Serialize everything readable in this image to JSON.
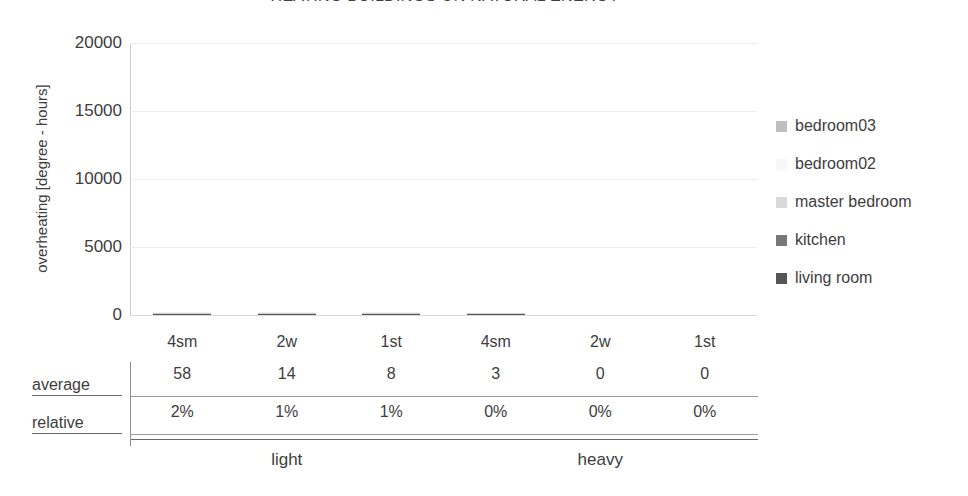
{
  "chart_data": {
    "type": "bar",
    "title": "HEATING BUILDINGS ON NATURAL ENERGY",
    "xlabel": "",
    "ylabel": "overheating [degree - hours]",
    "ylim": [
      0,
      20000
    ],
    "yticks": [
      20000,
      15000,
      10000,
      5000,
      0
    ],
    "ytick_labels": [
      "20000",
      "15000",
      "10000",
      "5000",
      "0"
    ],
    "grid": true,
    "stacked": true,
    "legend_position": "right",
    "categories": [
      "4sm",
      "2w",
      "1st",
      "4sm",
      "2w",
      "1st"
    ],
    "groups": [
      {
        "label": "light",
        "categories": [
          "4sm",
          "2w",
          "1st"
        ]
      },
      {
        "label": "heavy",
        "categories": [
          "4sm",
          "2w",
          "1st"
        ]
      }
    ],
    "series": [
      {
        "name": "living room",
        "color": "#595959",
        "values": [
          14,
          4,
          2,
          1,
          0,
          0
        ]
      },
      {
        "name": "kitchen",
        "color": "#808080",
        "values": [
          13,
          3,
          2,
          1,
          0,
          0
        ]
      },
      {
        "name": "master bedroom",
        "color": "#d0d0d0",
        "values": [
          11,
          3,
          2,
          1,
          0,
          0
        ]
      },
      {
        "name": "bedroom02",
        "color": "#f2f2f2",
        "values": [
          10,
          2,
          1,
          0,
          0,
          0
        ]
      },
      {
        "name": "bedroom03",
        "color": "#bfbfbf",
        "values": [
          10,
          2,
          1,
          0,
          0,
          0
        ]
      }
    ],
    "totals": [
      58,
      14,
      8,
      3,
      0,
      0
    ],
    "annotations": {
      "table": {
        "rows": [
          {
            "header": "average",
            "values": [
              "58",
              "14",
              "8",
              "3",
              "0",
              "0"
            ]
          },
          {
            "header": "relative",
            "values": [
              "2%",
              "1%",
              "1%",
              "0%",
              "0%",
              "0%"
            ]
          }
        ]
      }
    }
  },
  "legend": {
    "items": [
      {
        "label": "bedroom03",
        "color": "#bfbfbf"
      },
      {
        "label": "bedroom02",
        "color": "#f7f7f7"
      },
      {
        "label": "master bedroom",
        "color": "#d8d8d8"
      },
      {
        "label": "kitchen",
        "color": "#787878"
      },
      {
        "label": "living room",
        "color": "#555555"
      }
    ]
  },
  "colors": {
    "text": "#3d3d3d",
    "gridline": "#ededed",
    "rule": "#6a6a6a",
    "background": "#ffffff"
  }
}
